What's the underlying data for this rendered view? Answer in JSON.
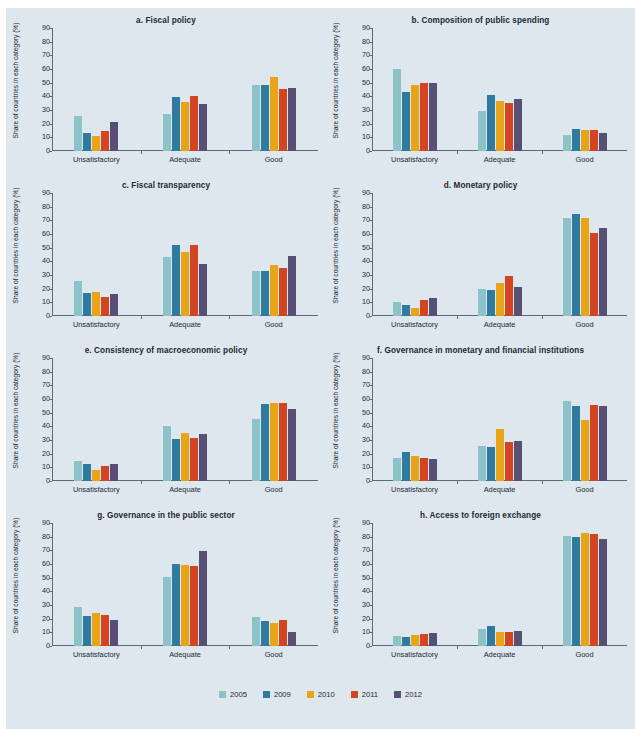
{
  "figure": {
    "background_color": "#dde7ed",
    "axis_color": "#5a6b78",
    "text_color": "#1b2733",
    "ylabel": "Share of countries in each category (%)",
    "categories": [
      "Unsatisfactory",
      "Adequate",
      "Good"
    ],
    "yticks": [
      "0",
      "10",
      "20",
      "30",
      "40",
      "50",
      "60",
      "70",
      "80",
      "90"
    ],
    "ylim": [
      0,
      90
    ]
  },
  "legend": {
    "position": "bottom-center",
    "items": [
      {
        "label": "2005",
        "color": "#8cc2c8"
      },
      {
        "label": "2009",
        "color": "#2f7ba0"
      },
      {
        "label": "2010",
        "color": "#e8a317"
      },
      {
        "label": "2011",
        "color": "#d44420"
      },
      {
        "label": "2012",
        "color": "#584f74"
      }
    ]
  },
  "chart_data": [
    {
      "type": "bar",
      "panel": "a",
      "title": "a.  Fiscal policy",
      "xlabel": "",
      "ylabel": "Share of countries in each category (%)",
      "ylim": [
        0,
        90
      ],
      "categories": [
        "Unsatisfactory",
        "Adequate",
        "Good"
      ],
      "series": [
        {
          "name": "2005",
          "values": [
            25.3,
            27.1,
            48.5
          ]
        },
        {
          "name": "2009",
          "values": [
            13.0,
            39.5,
            48.4
          ]
        },
        {
          "name": "2010",
          "values": [
            11.0,
            35.9,
            54.0
          ]
        },
        {
          "name": "2011",
          "values": [
            15.0,
            40.3,
            45.5
          ]
        },
        {
          "name": "2012",
          "values": [
            21.3,
            34.2,
            46.3
          ]
        }
      ]
    },
    {
      "type": "bar",
      "panel": "b",
      "title": "b.  Composition of public spending",
      "xlabel": "",
      "ylabel": "Share of countries in each category (%)",
      "ylim": [
        0,
        90
      ],
      "categories": [
        "Unsatisfactory",
        "Adequate",
        "Good"
      ],
      "series": [
        {
          "name": "2005",
          "values": [
            60.0,
            29.0,
            12.0
          ]
        },
        {
          "name": "2009",
          "values": [
            43.5,
            41.2,
            16.0
          ]
        },
        {
          "name": "2010",
          "values": [
            48.6,
            36.6,
            15.5
          ]
        },
        {
          "name": "2011",
          "values": [
            49.7,
            35.2,
            15.6
          ]
        },
        {
          "name": "2012",
          "values": [
            50.0,
            38.2,
            13.0
          ]
        }
      ]
    },
    {
      "type": "bar",
      "panel": "c",
      "title": "c.  Fiscal transparency",
      "xlabel": "",
      "ylabel": "Share of countries in each category (%)",
      "ylim": [
        0,
        90
      ],
      "categories": [
        "Unsatisfactory",
        "Adequate",
        "Good"
      ],
      "series": [
        {
          "name": "2005",
          "values": [
            25.4,
            43.0,
            33.0
          ]
        },
        {
          "name": "2009",
          "values": [
            17.0,
            52.0,
            32.8
          ]
        },
        {
          "name": "2010",
          "values": [
            17.8,
            46.8,
            37.2
          ]
        },
        {
          "name": "2011",
          "values": [
            14.0,
            52.0,
            35.4
          ]
        },
        {
          "name": "2012",
          "values": [
            16.0,
            38.4,
            44.0
          ]
        }
      ]
    },
    {
      "type": "bar",
      "panel": "d",
      "title": "d.  Monetary policy",
      "xlabel": "",
      "ylabel": "Share of countries in each category (%)",
      "ylim": [
        0,
        90
      ],
      "categories": [
        "Unsatisfactory",
        "Adequate",
        "Good"
      ],
      "series": [
        {
          "name": "2005",
          "values": [
            10.3,
            19.5,
            71.5
          ]
        },
        {
          "name": "2009",
          "values": [
            8.0,
            18.8,
            74.3
          ]
        },
        {
          "name": "2010",
          "values": [
            5.9,
            24.0,
            71.6
          ]
        },
        {
          "name": "2011",
          "values": [
            11.8,
            29.2,
            60.6
          ]
        },
        {
          "name": "2012",
          "values": [
            13.0,
            21.2,
            64.4
          ]
        }
      ]
    },
    {
      "type": "bar",
      "panel": "e",
      "title": "e.  Consistency of macroeconomic policy",
      "xlabel": "",
      "ylabel": "Share of countries in each category (%)",
      "ylim": [
        0,
        90
      ],
      "categories": [
        "Unsatisfactory",
        "Adequate",
        "Good"
      ],
      "series": [
        {
          "name": "2005",
          "values": [
            14.8,
            40.1,
            45.5
          ]
        },
        {
          "name": "2009",
          "values": [
            12.8,
            31.0,
            56.5
          ]
        },
        {
          "name": "2010",
          "values": [
            8.0,
            35.4,
            57.0
          ]
        },
        {
          "name": "2011",
          "values": [
            11.0,
            31.8,
            57.0
          ]
        },
        {
          "name": "2012",
          "values": [
            12.2,
            34.4,
            53.0
          ]
        }
      ]
    },
    {
      "type": "bar",
      "panel": "f",
      "title": "f.  Governance in monetary and financial institutions",
      "xlabel": "",
      "ylabel": "Share of countries in each category (%)",
      "ylim": [
        0,
        90
      ],
      "categories": [
        "Unsatisfactory",
        "Adequate",
        "Good"
      ],
      "series": [
        {
          "name": "2005",
          "values": [
            16.5,
            25.6,
            58.8
          ]
        },
        {
          "name": "2009",
          "values": [
            21.0,
            24.9,
            55.2
          ]
        },
        {
          "name": "2010",
          "values": [
            18.3,
            38.2,
            45.0
          ]
        },
        {
          "name": "2011",
          "values": [
            17.0,
            28.8,
            55.7
          ]
        },
        {
          "name": "2012",
          "values": [
            15.8,
            29.2,
            55.0
          ]
        }
      ]
    },
    {
      "type": "bar",
      "panel": "g",
      "title": "g.  Governance in the public sector",
      "xlabel": "",
      "ylabel": "Share of countries in each category (%)",
      "ylim": [
        0,
        90
      ],
      "categories": [
        "Unsatisfactory",
        "Adequate",
        "Good"
      ],
      "series": [
        {
          "name": "2005",
          "values": [
            28.5,
            50.3,
            21.5
          ]
        },
        {
          "name": "2009",
          "values": [
            21.8,
            60.3,
            18.2
          ]
        },
        {
          "name": "2010",
          "values": [
            24.2,
            59.2,
            16.5
          ]
        },
        {
          "name": "2011",
          "values": [
            22.5,
            58.5,
            19.0
          ]
        },
        {
          "name": "2012",
          "values": [
            18.7,
            69.5,
            9.9
          ]
        }
      ]
    },
    {
      "type": "bar",
      "panel": "h",
      "title": "h.  Access to foreign exchange",
      "xlabel": "",
      "ylabel": "Share of countries in each category (%)",
      "ylim": [
        0,
        90
      ],
      "categories": [
        "Unsatisfactory",
        "Adequate",
        "Good"
      ],
      "series": [
        {
          "name": "2005",
          "values": [
            7.5,
            12.8,
            80.7
          ]
        },
        {
          "name": "2009",
          "values": [
            6.7,
            14.5,
            80.0
          ]
        },
        {
          "name": "2010",
          "values": [
            8.0,
            10.0,
            82.8
          ]
        },
        {
          "name": "2011",
          "values": [
            8.8,
            10.5,
            81.7
          ]
        },
        {
          "name": "2012",
          "values": [
            9.6,
            11.2,
            78.0
          ]
        }
      ]
    }
  ]
}
